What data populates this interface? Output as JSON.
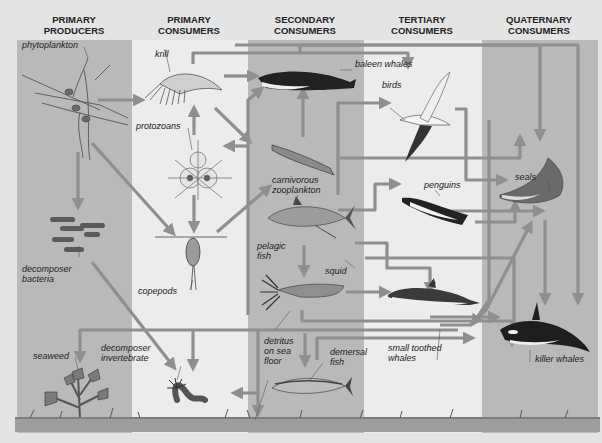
{
  "headers": [
    {
      "line1": "PRIMARY",
      "line2": "PRODUCERS"
    },
    {
      "line1": "PRIMARY",
      "line2": "CONSUMERS"
    },
    {
      "line1": "SECONDARY",
      "line2": "CONSUMERS"
    },
    {
      "line1": "TERTIARY",
      "line2": "CONSUMERS"
    },
    {
      "line1": "QUATERNARY",
      "line2": "CONSUMERS"
    }
  ],
  "organisms": {
    "phytoplankton": "phytoplankton",
    "krill": "krill",
    "protozoans": "protozoans",
    "decomposer_bacteria_1": "decomposer",
    "decomposer_bacteria_2": "bacteria",
    "copepods": "copepods",
    "seaweed": "seaweed",
    "decomposer_invertebrate_1": "decomposer",
    "decomposer_invertebrate_2": "invertebrate",
    "baleen_whales": "baleen whales",
    "carnivorous_zooplankton_1": "carnivorous",
    "carnivorous_zooplankton_2": "zooplankton",
    "pelagic_fish_1": "pelagic",
    "pelagic_fish_2": "fish",
    "squid": "squid",
    "detritus_1": "detritus",
    "detritus_2": "on sea",
    "detritus_3": "floor",
    "demersal_fish_1": "demersal",
    "demersal_fish_2": "fish",
    "birds": "birds",
    "penguins": "penguins",
    "small_toothed_whales_1": "small toothed",
    "small_toothed_whales_2": "whales",
    "seals": "seals",
    "killer_whales": "killer whales"
  },
  "colors": {
    "page_bg": "#e4e4e4",
    "band_dark": "#b9b9b9",
    "band_light": "#ececec",
    "arrow": "#8f8f8f",
    "text": "#222222"
  }
}
